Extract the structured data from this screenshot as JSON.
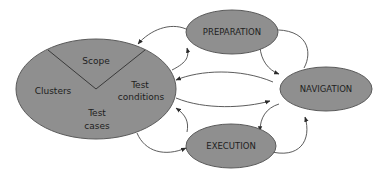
{
  "diagram": {
    "main_node": {
      "segments": {
        "scope": "Scope",
        "clusters": "Clusters",
        "test_conditions_line1": "Test",
        "test_conditions_line2": "conditions",
        "test_cases_line1": "Test",
        "test_cases_line2": "cases"
      }
    },
    "nodes": {
      "preparation": "PREPARATION",
      "navigation": "NAVIGATION",
      "execution": "EXECUTION"
    },
    "colors": {
      "node_fill": "#8f8f8f",
      "node_stroke": "#5a5a5a",
      "edge": "#4a4a4a",
      "text": "#1e1e1e",
      "background": "#ffffff"
    },
    "edges": [
      {
        "from": "main",
        "to": "preparation"
      },
      {
        "from": "preparation",
        "to": "main"
      },
      {
        "from": "preparation",
        "to": "navigation"
      },
      {
        "from": "navigation",
        "to": "preparation"
      },
      {
        "from": "navigation",
        "to": "main"
      },
      {
        "from": "main",
        "to": "navigation"
      },
      {
        "from": "navigation",
        "to": "execution"
      },
      {
        "from": "execution",
        "to": "navigation"
      },
      {
        "from": "execution",
        "to": "main"
      },
      {
        "from": "main",
        "to": "execution"
      }
    ]
  }
}
